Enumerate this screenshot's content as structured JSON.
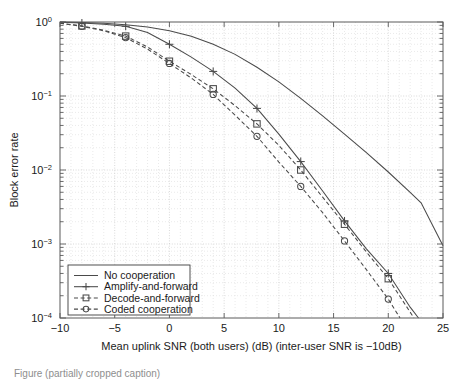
{
  "figure": {
    "background": "#ffffff",
    "line_color": "#4a4a4a",
    "grid_color": "#c9c9c9",
    "axis_color": "#5a5a5a"
  },
  "axes": {
    "xlabel": "Mean uplink SNR (both users) (dB) (inter-user SNR is −10dB)",
    "ylabel": "Block error rate",
    "x_ticks": [
      "−10",
      "−5",
      "0",
      "5",
      "10",
      "15",
      "20",
      "25"
    ],
    "x_tick_values": [
      -10,
      -5,
      0,
      5,
      10,
      15,
      20,
      25
    ],
    "y_tick_mantissa": [
      "10",
      "10",
      "10",
      "10",
      "10"
    ],
    "y_tick_exponents": [
      "0",
      "−1",
      "−2",
      "−3",
      "−4"
    ],
    "y_tick_values": [
      1,
      0.1,
      0.01,
      0.001,
      0.0001
    ],
    "xlim": [
      -10,
      25
    ],
    "ylim": [
      0.0001,
      1
    ],
    "yscale": "log",
    "grid": "on (major and minor, dotted)"
  },
  "legend": {
    "position": "lower-left inside axes",
    "entries": [
      {
        "label": "No cooperation",
        "marker": "none",
        "linestyle": "solid"
      },
      {
        "label": "Amplify-and-forward",
        "marker": "plus",
        "linestyle": "solid"
      },
      {
        "label": "Decode-and-forward",
        "marker": "square",
        "linestyle": "dashed"
      },
      {
        "label": "Coded cooperation",
        "marker": "circle",
        "linestyle": "dashed"
      }
    ]
  },
  "caption": {
    "text": "Figure (partially cropped caption)"
  },
  "chart_data": {
    "type": "line",
    "title": "",
    "xlabel": "Mean uplink SNR (both users) (dB) (inter-user SNR is −10dB)",
    "ylabel": "Block error rate",
    "xlim": [
      -10,
      25
    ],
    "ylim": [
      0.0001,
      1
    ],
    "yscale": "log",
    "grid": true,
    "legend_position": "lower-left",
    "x": [
      -10,
      -8,
      -6,
      -4,
      -2,
      0,
      2,
      4,
      6,
      8,
      10,
      12,
      14,
      16,
      18,
      20,
      22,
      23,
      25
    ],
    "series": [
      {
        "name": "No cooperation",
        "marker": "none",
        "linestyle": "solid",
        "values": [
          1.0,
          0.985,
          0.96,
          0.92,
          0.855,
          0.76,
          0.64,
          0.5,
          0.365,
          0.245,
          0.155,
          0.093,
          0.054,
          0.0305,
          0.0172,
          0.0094,
          0.005,
          0.0036,
          0.00095
        ]
      },
      {
        "name": "Amplify-and-forward",
        "marker": "plus",
        "linestyle": "solid",
        "marker_x": [
          -8,
          -4,
          0,
          4,
          8,
          12,
          16,
          20
        ],
        "marker_y": [
          0.97,
          0.875,
          0.5,
          0.215,
          0.068,
          0.013,
          0.00205,
          0.0004
        ],
        "values": [
          0.995,
          0.97,
          0.935,
          0.875,
          0.72,
          0.5,
          0.335,
          0.215,
          0.128,
          0.068,
          0.0305,
          0.013,
          0.0052,
          0.00205,
          0.00086,
          0.0004,
          0.00014,
          9e-05,
          4e-05
        ]
      },
      {
        "name": "Decode-and-forward",
        "marker": "square",
        "linestyle": "dashed",
        "marker_x": [
          -8,
          -4,
          0,
          4,
          8,
          12,
          16,
          20
        ],
        "marker_y": [
          0.885,
          0.645,
          0.295,
          0.125,
          0.042,
          0.01,
          0.00185,
          0.00034
        ],
        "values": [
          0.965,
          0.885,
          0.775,
          0.645,
          0.46,
          0.295,
          0.195,
          0.125,
          0.074,
          0.042,
          0.0215,
          0.01,
          0.0043,
          0.00185,
          0.00078,
          0.00034,
          0.00012,
          7e-05,
          3e-05
        ]
      },
      {
        "name": "Coded cooperation",
        "marker": "circle",
        "linestyle": "dashed",
        "marker_x": [
          -8,
          -4,
          0,
          4,
          8,
          12,
          16,
          20
        ],
        "marker_y": [
          0.875,
          0.615,
          0.275,
          0.105,
          0.0285,
          0.006,
          0.0011,
          0.00018
        ],
        "values": [
          0.96,
          0.875,
          0.76,
          0.615,
          0.43,
          0.275,
          0.175,
          0.105,
          0.055,
          0.0285,
          0.0128,
          0.006,
          0.00265,
          0.0011,
          0.00045,
          0.00018,
          6e-05,
          4e-05,
          2e-05
        ]
      }
    ]
  }
}
